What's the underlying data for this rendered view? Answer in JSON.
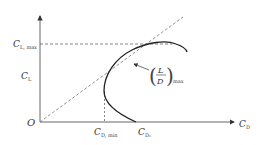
{
  "diagram": {
    "origin_label": "O",
    "x_axis": {
      "symbol": "C",
      "subscript": "D"
    },
    "y_axis": {
      "symbol": "C",
      "subscript": "L"
    },
    "y_marks": [
      {
        "symbol": "C",
        "subscript": "L, max"
      }
    ],
    "x_marks": [
      {
        "symbol": "C",
        "subscript": "D, min"
      },
      {
        "symbol": "C",
        "subscript": "D₀"
      }
    ],
    "annotation": {
      "numerator": "L",
      "denominator": "D",
      "subscript": "max"
    },
    "colors": {
      "axis": "#555555",
      "curve": "#222222",
      "dashed": "#666666",
      "text": "#333333"
    }
  }
}
